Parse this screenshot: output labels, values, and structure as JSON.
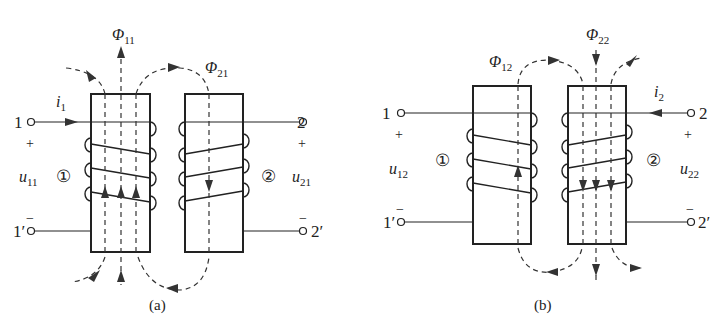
{
  "figure": {
    "panels": [
      {
        "id": "a",
        "caption": "(a)",
        "terminals": {
          "t1": "1",
          "t1p": "1′",
          "t2": "2",
          "t2p": "2′"
        },
        "polarity": {
          "plus1": "+",
          "minus1": "−",
          "plus2": "+",
          "minus2": "−"
        },
        "current": {
          "sym": "i",
          "sub": "1"
        },
        "coil1": "①",
        "coil2": "②",
        "voltage1": {
          "sym": "u",
          "sub": "11"
        },
        "voltage2": {
          "sym": "u",
          "sub": "21"
        },
        "flux_self": {
          "sym": "Φ",
          "sub": "11"
        },
        "flux_mutual": {
          "sym": "Φ",
          "sub": "21"
        }
      },
      {
        "id": "b",
        "caption": "(b)",
        "terminals": {
          "t1": "1",
          "t1p": "1′",
          "t2": "2",
          "t2p": "2′"
        },
        "polarity": {
          "plus1": "+",
          "minus1": "−",
          "plus2": "+",
          "minus2": "−"
        },
        "current": {
          "sym": "i",
          "sub": "2"
        },
        "coil1": "①",
        "coil2": "②",
        "voltage1": {
          "sym": "u",
          "sub": "12"
        },
        "voltage2": {
          "sym": "u",
          "sub": "22"
        },
        "flux_self": {
          "sym": "Φ",
          "sub": "22"
        },
        "flux_mutual": {
          "sym": "Φ",
          "sub": "12"
        }
      }
    ],
    "colors": {
      "line": "#222222",
      "dash": "#333333",
      "background": "#ffffff"
    }
  }
}
